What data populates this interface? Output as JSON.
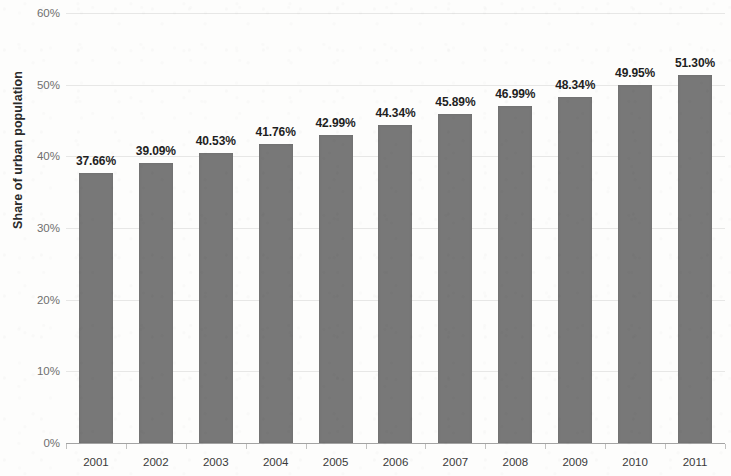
{
  "chart_data": {
    "type": "bar",
    "title": "",
    "subtitle": "",
    "xlabel": "",
    "ylabel": "Share of urban population",
    "categories": [
      "2001",
      "2002",
      "2003",
      "2004",
      "2005",
      "2006",
      "2007",
      "2008",
      "2009",
      "2010",
      "2011"
    ],
    "values": [
      37.66,
      39.09,
      40.53,
      41.76,
      42.99,
      44.34,
      45.89,
      46.99,
      48.34,
      49.95,
      51.3
    ],
    "data_labels": [
      "37.66%",
      "39.09%",
      "40.53%",
      "41.76%",
      "42.99%",
      "44.34%",
      "45.89%",
      "46.99%",
      "48.34%",
      "49.95%",
      "51.30%"
    ],
    "ylim": [
      0,
      60
    ],
    "y_ticks": [
      0,
      10,
      20,
      30,
      40,
      50,
      60
    ],
    "y_tick_labels": [
      "0%",
      "10%",
      "20%",
      "30%",
      "40%",
      "50%",
      "60%"
    ],
    "grid": true,
    "legend": false,
    "legend_position": "none",
    "series_color": "#787878",
    "label_color": "#1f1f1f",
    "axis_text_color": "#6f6f6f"
  }
}
